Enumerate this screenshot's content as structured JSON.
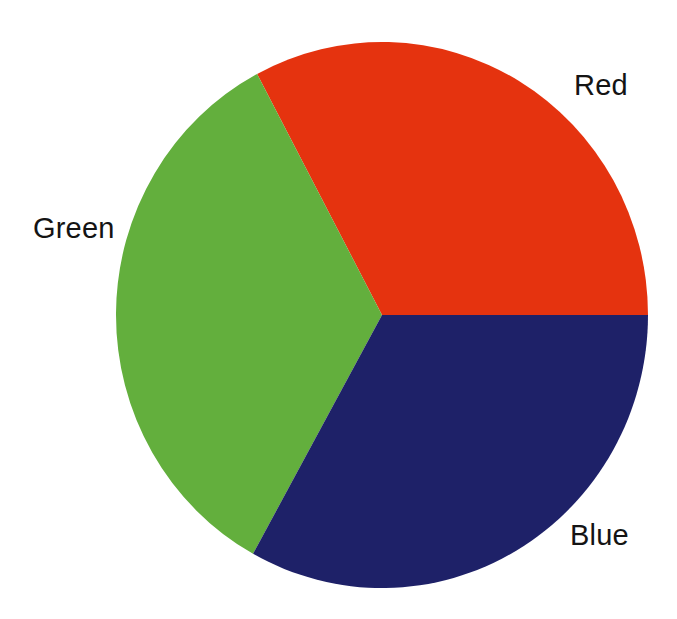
{
  "chart_data": {
    "type": "pie",
    "title": "",
    "subtitle": "",
    "xlabel": "",
    "ylabel": "",
    "legend_position": "none",
    "grid": false,
    "labels_outside": true,
    "background_color": "#ffffff",
    "label_text_color": "#141414",
    "categories": [
      "Red",
      "Green",
      "Blue"
    ],
    "values": [
      33.3,
      33.3,
      33.4
    ],
    "units": "percent",
    "colors": [
      "#e5330f",
      "#63af3d",
      "#1e2168"
    ],
    "slices": [
      {
        "name": "Red",
        "label": "Red",
        "value": 33.3,
        "color": "#e5330f",
        "start_angle_deg": 332,
        "end_angle_deg": 450,
        "sweep_deg": 118,
        "label_position": "right-top"
      },
      {
        "name": "Blue",
        "label": "Blue",
        "value": 33.4,
        "color": "#1e2168",
        "start_angle_deg": 90,
        "end_angle_deg": 209,
        "sweep_deg": 119,
        "label_position": "right-bottom"
      },
      {
        "name": "Green",
        "label": "Green",
        "value": 33.3,
        "color": "#63af3d",
        "start_angle_deg": 209,
        "end_angle_deg": 332,
        "sweep_deg": 123,
        "label_position": "left-middle"
      }
    ],
    "geometry": {
      "center_x": 382,
      "center_y": 315,
      "radius_x": 266,
      "radius_y": 273
    }
  },
  "labels": {
    "red": "Red",
    "green": "Green",
    "blue": "Blue"
  }
}
